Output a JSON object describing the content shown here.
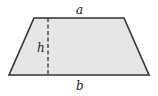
{
  "diagram": {
    "labels": {
      "top_base": "a",
      "height": "h",
      "bottom_base": "b"
    },
    "colors": {
      "fill": "#e6e6e6",
      "stroke": "#333333"
    }
  }
}
